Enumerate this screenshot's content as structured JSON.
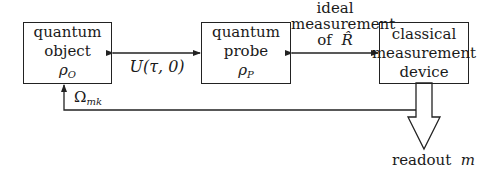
{
  "diagram": {
    "boxes": [
      {
        "id": "quantum-object",
        "lines": [
          "quantum",
          "object"
        ],
        "symbol": "ρ",
        "symbol_sub": "O"
      },
      {
        "id": "quantum-probe",
        "lines": [
          "quantum",
          "probe"
        ],
        "symbol": "ρ",
        "symbol_sub": "P"
      },
      {
        "id": "classical-measurement-device",
        "lines": [
          "classical",
          "measurement",
          "device"
        ]
      }
    ],
    "edges": [
      {
        "from": "quantum-object",
        "to": "quantum-probe",
        "type": "bidirectional",
        "label": "U(τ, 0)"
      },
      {
        "from": "quantum-probe",
        "to": "classical-measurement-device",
        "type": "bidirectional",
        "label_lines": [
          "ideal",
          "measurement",
          "of"
        ],
        "label_symbol": "R̂"
      },
      {
        "from": "classical-measurement-device",
        "to": "quantum-object",
        "type": "feedback",
        "label": "Ω",
        "label_sub": "mk"
      },
      {
        "from": "classical-measurement-device",
        "to": "readout",
        "type": "hollow-arrow"
      }
    ],
    "readout": {
      "text": "readout",
      "symbol": "m"
    }
  }
}
